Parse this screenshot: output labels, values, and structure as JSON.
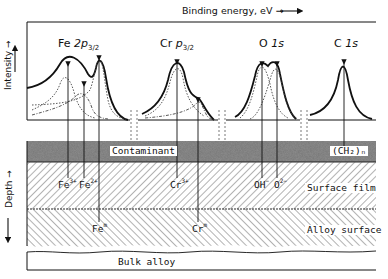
{
  "figure": {
    "top_axis_label": "Binding energy, eV →",
    "y_axis_label": "Intensity →",
    "depth_axis_label": "Depth →",
    "spectra": [
      {
        "element": "Fe",
        "orbital": "2p",
        "subscript": "3/2",
        "peaks": [
          "Fe3+",
          "Fe2+",
          "Fem"
        ]
      },
      {
        "element": "Cr",
        "orbital": "p",
        "subscript": "3/2",
        "peaks": [
          "Cr3+",
          "Crm"
        ]
      },
      {
        "element": "O",
        "orbital": "1s",
        "subscript": "",
        "peaks": [
          "OH-",
          "O2-"
        ]
      },
      {
        "element": "C",
        "orbital": "1s",
        "subscript": "",
        "peaks": [
          "(CH2)n"
        ]
      }
    ],
    "layers": [
      {
        "name": "Contaminant",
        "pattern": "stipple",
        "species": [
          "(CH2)n"
        ]
      },
      {
        "name": "Surface film",
        "pattern": "hatch-forward",
        "species": [
          "Fe3+",
          "Fe2+",
          "Cr3+",
          "OH-",
          "O2-"
        ]
      },
      {
        "name": "Alloy surface",
        "pattern": "hatch-backward",
        "species": [
          "Fem",
          "Crm"
        ]
      },
      {
        "name": "Bulk alloy",
        "pattern": "plain",
        "species": []
      }
    ],
    "species_labels": {
      "fe3": {
        "base": "Fe",
        "sup": "3+"
      },
      "fe2": {
        "base": "Fe",
        "sup": "2+"
      },
      "fem": {
        "base": "Fe",
        "sup": "m"
      },
      "cr3": {
        "base": "Cr",
        "sup": "3+"
      },
      "crm": {
        "base": "Cr",
        "sup": "m"
      },
      "oh": {
        "base": "OH",
        "sup": "−"
      },
      "o2": {
        "base": "O",
        "sup": "2−"
      },
      "ch2": {
        "text": "(CH₂)ₙ"
      }
    },
    "colors": {
      "ink": "#111111",
      "contaminant": "#6e6e6e",
      "background": "#ffffff"
    }
  }
}
